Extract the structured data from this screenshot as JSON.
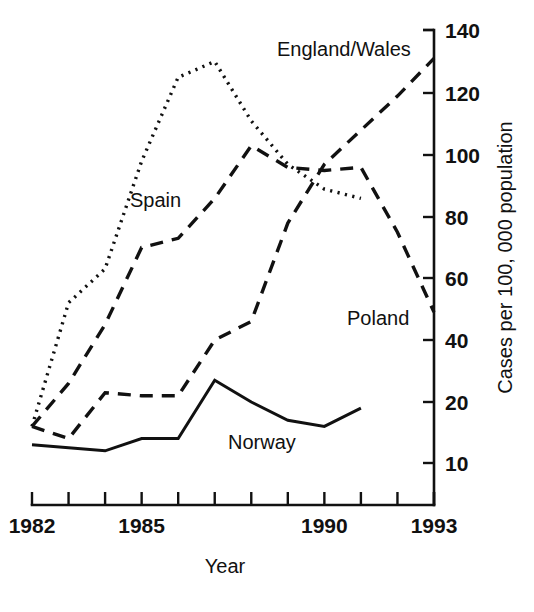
{
  "chart_data": {
    "type": "line",
    "title": "",
    "xlabel": "Year",
    "ylabel": "Cases per 100, 000 population",
    "x": [
      1982,
      1983,
      1984,
      1985,
      1986,
      1987,
      1988,
      1989,
      1990,
      1991,
      1992,
      1993
    ],
    "xlim": [
      1982,
      1993
    ],
    "x_tick_values": [
      1982,
      1983,
      1984,
      1985,
      1986,
      1987,
      1988,
      1989,
      1990,
      1991,
      1992,
      1993
    ],
    "x_tick_labels": [
      "1982",
      "",
      "",
      "1985",
      "",
      "",
      "",
      "",
      "1990",
      "",
      "",
      "1993"
    ],
    "y_tick_labels": [
      "140",
      "120",
      "100",
      "80",
      "60",
      "40",
      "20",
      "10"
    ],
    "y_tick_values": [
      140,
      120,
      100,
      80,
      60,
      40,
      20,
      10
    ],
    "y_axis_note": "axis breaks below 20; the 20-to-10 interval occupies the same spacing as each 20-unit interval",
    "grid": false,
    "legend_position": "inline-labels",
    "series": [
      {
        "name": "Spain",
        "style": "dotted",
        "label_x": 1986,
        "points": [
          {
            "x": 1982,
            "y": 16
          },
          {
            "x": 1983,
            "y": 52
          },
          {
            "x": 1984,
            "y": 63
          },
          {
            "x": 1985,
            "y": 98
          },
          {
            "x": 1986,
            "y": 125
          },
          {
            "x": 1987,
            "y": 130
          },
          {
            "x": 1988,
            "y": 111
          },
          {
            "x": 1989,
            "y": 97
          },
          {
            "x": 1990,
            "y": 89
          },
          {
            "x": 1991,
            "y": 86
          }
        ]
      },
      {
        "name": "Poland",
        "style": "dashed",
        "label_x": 1991,
        "points": [
          {
            "x": 1982,
            "y": 16
          },
          {
            "x": 1983,
            "y": 26
          },
          {
            "x": 1984,
            "y": 45
          },
          {
            "x": 1985,
            "y": 70
          },
          {
            "x": 1986,
            "y": 73
          },
          {
            "x": 1987,
            "y": 86
          },
          {
            "x": 1988,
            "y": 103
          },
          {
            "x": 1989,
            "y": 96
          },
          {
            "x": 1990,
            "y": 95
          },
          {
            "x": 1991,
            "y": 96
          },
          {
            "x": 1992,
            "y": 75
          },
          {
            "x": 1993,
            "y": 49
          }
        ]
      },
      {
        "name": "England/Wales",
        "style": "dashed",
        "label_x": 1988,
        "points": [
          {
            "x": 1982,
            "y": 16
          },
          {
            "x": 1983,
            "y": 14
          },
          {
            "x": 1984,
            "y": 23
          },
          {
            "x": 1985,
            "y": 22
          },
          {
            "x": 1986,
            "y": 22
          },
          {
            "x": 1987,
            "y": 40
          },
          {
            "x": 1988,
            "y": 46
          },
          {
            "x": 1989,
            "y": 78
          },
          {
            "x": 1990,
            "y": 97
          },
          {
            "x": 1991,
            "y": 108
          },
          {
            "x": 1992,
            "y": 119
          },
          {
            "x": 1993,
            "y": 131
          }
        ]
      },
      {
        "name": "Norway",
        "style": "solid",
        "label_x": 1990,
        "points": [
          {
            "x": 1982,
            "y": 13
          },
          {
            "x": 1984,
            "y": 12
          },
          {
            "x": 1985,
            "y": 14
          },
          {
            "x": 1986,
            "y": 14
          },
          {
            "x": 1987,
            "y": 27
          },
          {
            "x": 1988,
            "y": 20
          },
          {
            "x": 1989,
            "y": 17
          },
          {
            "x": 1990,
            "y": 16
          },
          {
            "x": 1991,
            "y": 19
          }
        ]
      }
    ]
  }
}
